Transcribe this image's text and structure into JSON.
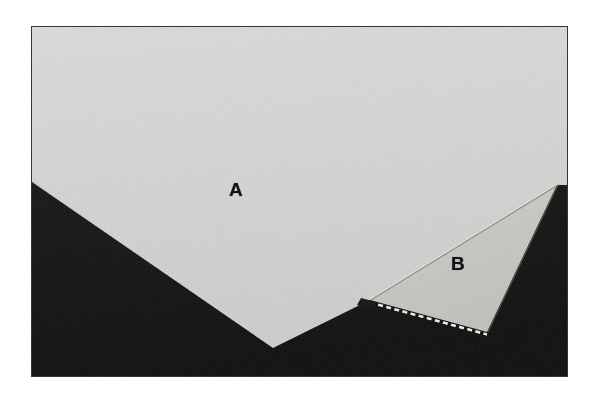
{
  "figure": {
    "type": "photomicrograph",
    "caption_labels": [
      "A",
      "B"
    ],
    "background_color": "#ffffff",
    "plate": {
      "x": 31,
      "y": 26,
      "width": 537,
      "height": 351,
      "border_color": "#3a3a3a"
    },
    "palette": {
      "region_a_fill": "#d6d6d4",
      "region_b_fill": "#c9c9c6",
      "dark_fill": "#141313",
      "dark_fill_2": "#1b1a19",
      "edge_highlight": "#efefed",
      "divider_line": "#8e8e8b",
      "label_color": "#121212",
      "dash_color": "#e4e4e0"
    },
    "regions": [
      {
        "id": "region-a",
        "label": "A",
        "label_x": 236,
        "label_y": 189,
        "fill": "#d6d6d4",
        "description": "large light cleavage facet",
        "points": "0,0 537,0 537,159 526,159 339,274 242,322 1,156"
      },
      {
        "id": "region-b",
        "label": "B",
        "label_x": 457,
        "label_y": 263,
        "fill": "#c9c9c6",
        "description": "smaller shaded cleavage facet",
        "points": "339,274 526,159 456,306"
      }
    ],
    "dark_shapes": [
      {
        "id": "dark-lower-left",
        "fill": "#141313",
        "points": "0,156 242,322 339,274 456,306 537,351 0,351"
      },
      {
        "id": "dark-right-wedge",
        "fill": "#141313",
        "points": "526,159 537,159 537,351 456,306"
      }
    ],
    "dashed_edge": {
      "id": "dashed-edge",
      "description": "serrated bright dashes along lower edge of region B",
      "x1": 339,
      "y1": 275,
      "x2": 456,
      "y2": 307,
      "dash_pattern": "5 3",
      "stroke_width": 2.4,
      "color": "#e8e8e4"
    },
    "highlight_edges": [
      {
        "id": "edge-a-upper-right",
        "x1": 339,
        "y1": 274,
        "x2": 526,
        "y2": 159,
        "color": "#9a9a97",
        "width": 1.1
      },
      {
        "id": "edge-a-left",
        "x1": 1,
        "y1": 156,
        "x2": 242,
        "y2": 322,
        "color": "#b5b5b2",
        "width": 0.8
      }
    ]
  }
}
